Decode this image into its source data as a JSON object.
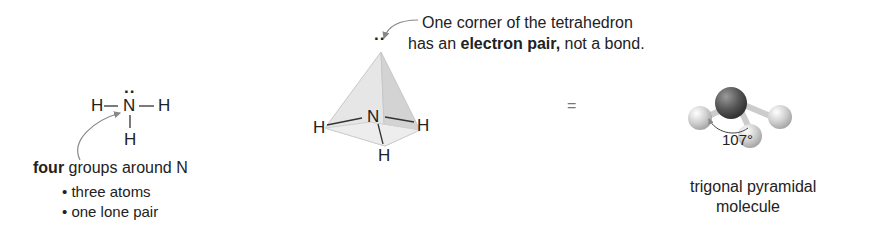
{
  "lewis_structure": {
    "central_atom": "N",
    "lone_pair_dots": "··",
    "left_atom": "H",
    "right_atom": "H",
    "bottom_atom": "H",
    "caption_bold": "four",
    "caption_rest": " groups around N",
    "bullets": [
      "• three atoms",
      "• one lone pair"
    ]
  },
  "tetrahedron": {
    "central_atom": "N",
    "atoms": [
      "H",
      "H",
      "H"
    ],
    "lone_pair_dots": "··",
    "annotation_line1": "One corner of the tetrahedron",
    "annotation_line2_pre": "has an ",
    "annotation_line2_bold": "electron pair,",
    "annotation_line2_post": " not a bond."
  },
  "equals_sign": "=",
  "ball_and_stick": {
    "angle_label": "107°",
    "caption_line1": "trigonal pyramidal",
    "caption_line2": "molecule",
    "colors": {
      "central_atom": "#555555",
      "outer_atom": "#d0d0d0"
    }
  }
}
